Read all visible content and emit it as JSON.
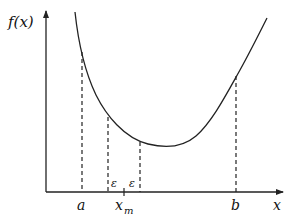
{
  "diagram": {
    "type": "function-plot",
    "y_axis_label": "f(x)",
    "x_axis_label": "x",
    "ticks": {
      "a": "a",
      "xm": "x",
      "xm_sub": "m",
      "b": "b"
    },
    "epsilon_left": "ε",
    "epsilon_right": "ε",
    "colors": {
      "stroke": "#222222",
      "background": "#ffffff"
    }
  }
}
